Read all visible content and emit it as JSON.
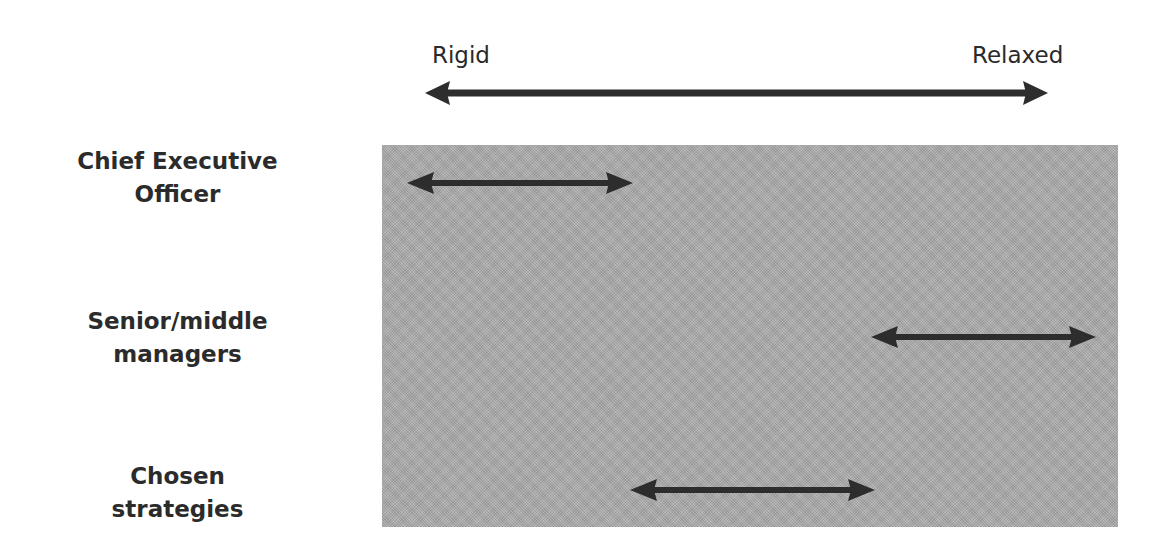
{
  "scale": {
    "left_label": "Rigid",
    "right_label": "Relaxed",
    "arrow": {
      "x1": 425,
      "x2": 1048,
      "y": 93
    }
  },
  "rows": [
    {
      "label_line1": "Chief Executive",
      "label_line2": "Officer",
      "range": {
        "x1": 407,
        "x2": 633,
        "y": 183
      },
      "position_description": "towards Rigid end"
    },
    {
      "label_line1": "Senior/middle",
      "label_line2": "managers",
      "range": {
        "x1": 871,
        "x2": 1096,
        "y": 337
      },
      "position_description": "towards Relaxed end"
    },
    {
      "label_line1": "Chosen",
      "label_line2": "strategies",
      "range": {
        "x1": 630,
        "x2": 875,
        "y": 490
      },
      "position_description": "middle of scale"
    }
  ],
  "colors": {
    "arrow": "#2d2d2d",
    "panel": "#a9a9a9",
    "text": "#2b2b2b",
    "background": "#ffffff"
  }
}
